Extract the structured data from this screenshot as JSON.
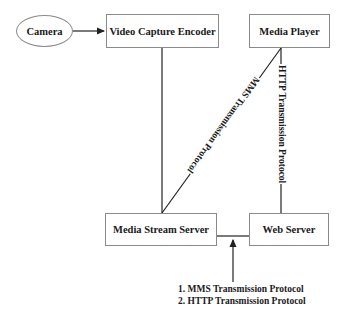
{
  "diagram": {
    "nodes": {
      "camera": "Camera",
      "encoder": "Video Capture Encoder",
      "player": "Media Player",
      "stream_server": "Media Stream Server",
      "web_server": "Web Server"
    },
    "edges": {
      "mms": "MMS Transmission Protocol",
      "http": "HTTP Transmission Protocol"
    },
    "note": {
      "line1": "1. MMS Transmission Protocol",
      "line2": "2. HTTP Transmission Protocol"
    }
  }
}
